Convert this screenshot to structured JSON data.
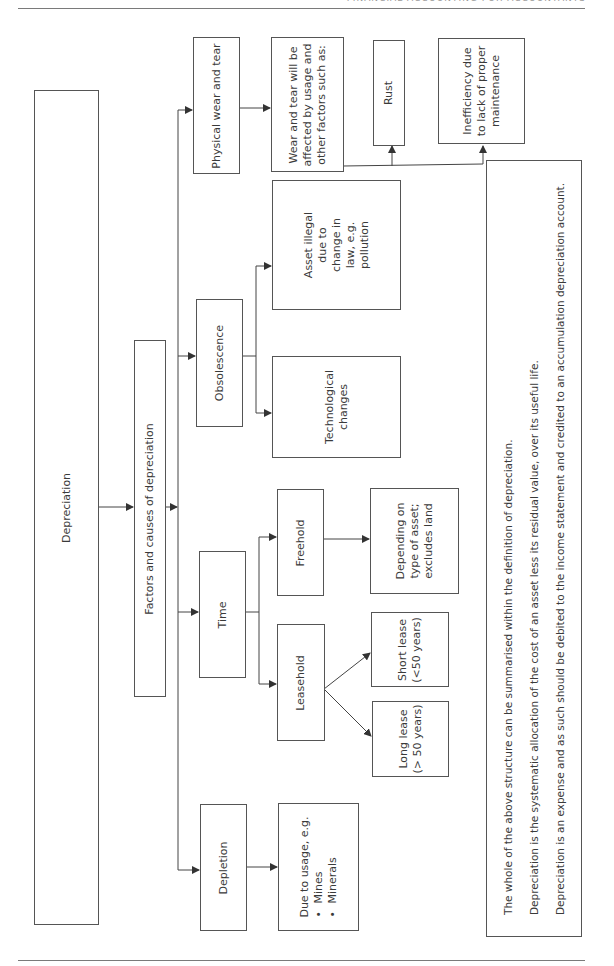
{
  "page": {
    "header_text": "FINANCIAL ACCOUNTING FOR ACCOUNTANTS"
  },
  "diagram": {
    "root": "Depreciation",
    "factors": "Factors and causes of depreciation",
    "physical": {
      "label": "Physical wear and tear",
      "detail": [
        "Wear and tear will be",
        "affected by usage and",
        "other factors such as:"
      ],
      "children": {
        "rust": "Rust",
        "inefficiency": [
          "Inefficiency due",
          "to lack of proper",
          "maintenance"
        ]
      }
    },
    "obsolescence": {
      "label": "Obsolescence",
      "children": {
        "asset_illegal": [
          "Asset illegal",
          "due to",
          "change in",
          "law, e.g.",
          "pollution"
        ],
        "technological": [
          "Technological",
          "changes"
        ]
      }
    },
    "time": {
      "label": "Time",
      "freehold": {
        "label": "Freehold",
        "detail": [
          "Depending on",
          "type of asset;",
          "excludes land"
        ]
      },
      "leasehold": {
        "label": "Leasehold",
        "short_lease": [
          "Short lease",
          "(<50 years)"
        ],
        "long_lease": [
          "Long lease",
          "(> 50 years)"
        ]
      }
    },
    "depletion": {
      "label": "Depletion",
      "detail_intro": "Due to usage, e.g.",
      "bullets": [
        "Mines",
        "Minerals"
      ]
    }
  },
  "summary": {
    "lines": [
      "The whole of the above structure can be summarised within the definition of depreciation.",
      "Depreciation is the systematic allocation of the cost of an asset less its residual value, over its useful life.",
      "Depreciation is an expense and as such should be debited to the income statement and credited to an accumulation depreciation account."
    ]
  },
  "colors": {
    "line": "#555555",
    "text": "#3a3a3a",
    "rule": "#7a7a7a"
  }
}
